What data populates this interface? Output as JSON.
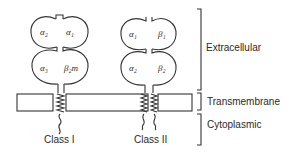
{
  "diagram": {
    "type": "MHC molecule structure",
    "regions": [
      {
        "id": "extracellular",
        "label": "Extracellular"
      },
      {
        "id": "transmembrane",
        "label": "Transmembrane"
      },
      {
        "id": "cytoplasmic",
        "label": "Cytoplasmic"
      }
    ],
    "molecules": [
      {
        "id": "class-1",
        "label": "Class I",
        "domains": {
          "top_left": "α₂",
          "top_right": "α₁",
          "bottom_left": "α₃",
          "bottom_right": "β₂m"
        }
      },
      {
        "id": "class-2",
        "label": "Class II",
        "domains": {
          "top_left": "α₁",
          "top_right": "β₁",
          "bottom_left": "α₂",
          "bottom_right": "β₂"
        }
      }
    ]
  }
}
